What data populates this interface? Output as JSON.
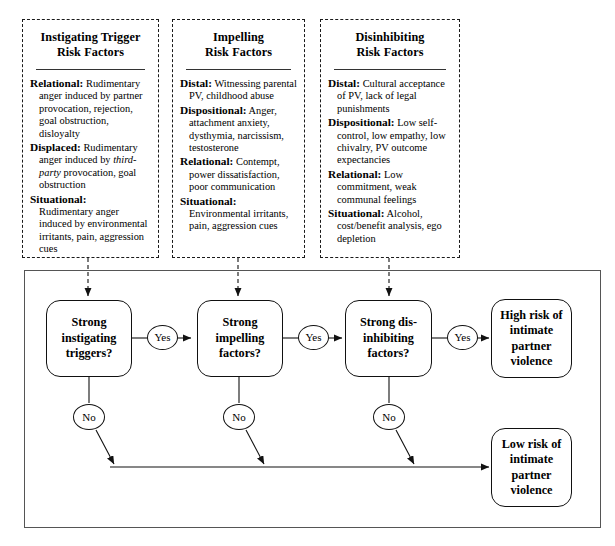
{
  "figure": {
    "panels": [
      {
        "id": "instigating",
        "title_line1": "Instigating Trigger",
        "title_line2": "Risk Factors",
        "factors": [
          {
            "label": "Relational:",
            "text": "Rudimentary anger induced by partner provocation, rejection, goal obstruction, disloyalty"
          },
          {
            "label": "Displaced:",
            "text": "Rudimentary anger induced by third-party provocation, goal obstruction",
            "italic_phrase": "third-party"
          },
          {
            "label": "Situational:",
            "text": "Rudimentary anger induced by environmental irritants, pain, aggression cues"
          }
        ]
      },
      {
        "id": "impelling",
        "title_line1": "Impelling",
        "title_line2": "Risk Factors",
        "factors": [
          {
            "label": "Distal:",
            "text": "Witnessing parental PV, childhood abuse"
          },
          {
            "label": "Dispositional:",
            "text": "Anger, attachment anxiety, dysthymia, narcissism, testosterone"
          },
          {
            "label": "Relational:",
            "text": "Contempt, power dissatisfaction, poor communication"
          },
          {
            "label": "Situational:",
            "text": "Environmental irritants, pain, aggression cues"
          }
        ]
      },
      {
        "id": "disinhibiting",
        "title_line1": "Disinhibiting",
        "title_line2": "Risk Factors",
        "factors": [
          {
            "label": "Distal:",
            "text": "Cultural acceptance of PV, lack of legal punishments"
          },
          {
            "label": "Dispositional:",
            "text": "Low self-control, low empathy, low chivalry, PV outcome expectancies"
          },
          {
            "label": "Relational:",
            "text": "Low commitment, weak communal feelings"
          },
          {
            "label": "Situational:",
            "text": "Alcohol, cost/benefit analysis, ego depletion"
          }
        ]
      }
    ],
    "flow": {
      "decisions": [
        {
          "id": "d1",
          "line1": "Strong",
          "line2": "instigating",
          "line3": "triggers?"
        },
        {
          "id": "d2",
          "line1": "Strong",
          "line2": "impelling",
          "line3": "factors?"
        },
        {
          "id": "d3",
          "line1": "Strong dis-",
          "line2": "inhibiting",
          "line3": "factors?"
        }
      ],
      "outcomes": [
        {
          "id": "high",
          "line1": "High risk of",
          "line2": "intimate",
          "line3": "partner",
          "line4": "violence"
        },
        {
          "id": "low",
          "line1": "Low risk of",
          "line2": "intimate",
          "line3": "partner",
          "line4": "violence"
        }
      ],
      "yes_label": "Yes",
      "no_label": "No"
    }
  },
  "colors": {
    "stroke": "#111111",
    "frame": "#555555",
    "background": "#ffffff"
  }
}
